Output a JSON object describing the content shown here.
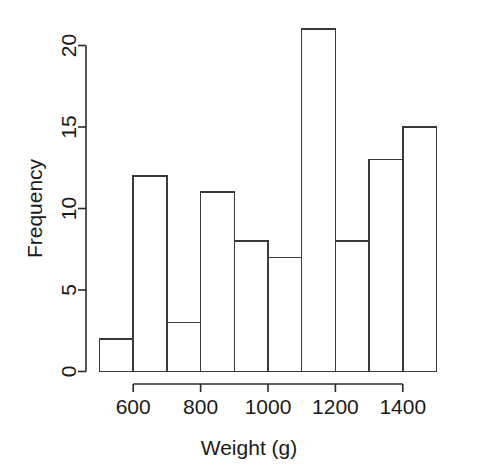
{
  "chart_data": {
    "type": "bar",
    "chart_style": "histogram",
    "title": "",
    "subtitle": "",
    "xlabel": "Weight (g)",
    "ylabel": "Frequency",
    "categories": [
      "500-600",
      "600-700",
      "700-800",
      "800-900",
      "900-1000",
      "1000-1100",
      "1100-1200",
      "1200-1300",
      "1300-1400",
      "1400-1500"
    ],
    "bin_edges": [
      500,
      600,
      700,
      800,
      900,
      1000,
      1100,
      1200,
      1300,
      1400,
      1500
    ],
    "bin_width": 100,
    "values": [
      2,
      12,
      3,
      11,
      8,
      7,
      21,
      8,
      13,
      15
    ],
    "x": [
      550,
      650,
      750,
      850,
      950,
      1050,
      1150,
      1250,
      1350,
      1450
    ],
    "xlim": [
      500,
      1500
    ],
    "ylim": [
      0,
      21
    ],
    "xticks": [
      600,
      800,
      1000,
      1200,
      1400
    ],
    "xtick_labels": [
      "600",
      "800",
      "1000",
      "1200",
      "1400"
    ],
    "yticks": [
      0,
      5,
      10,
      15,
      20
    ],
    "ytick_labels": [
      "0",
      "5",
      "10",
      "15",
      "20"
    ],
    "grid": false,
    "legend": null,
    "legend_position": "none",
    "annotations": [],
    "colors": {
      "bar_fill": "#ffffff",
      "bar_stroke": "#3a3a3a",
      "axis": "#2b2b2b",
      "text": "#1a1a1a",
      "background": "#ffffff"
    }
  }
}
